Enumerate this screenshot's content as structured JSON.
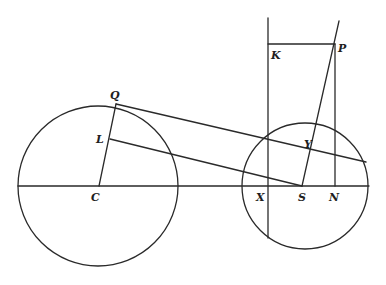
{
  "diagram": {
    "type": "geometric-figure",
    "stroke_color": "#2a2a2a",
    "background": "#ffffff",
    "circles": [
      {
        "id": "circle-C",
        "center_label": "C",
        "cx": 98,
        "cy": 186,
        "r": 80
      },
      {
        "id": "circle-S",
        "center_label": "S",
        "cx": 305,
        "cy": 186,
        "r": 63
      }
    ],
    "points": {
      "C": {
        "label": "C",
        "x": 98,
        "y": 186
      },
      "Q": {
        "label": "Q",
        "x": 116,
        "y": 104
      },
      "L": {
        "label": "L",
        "x": 110,
        "y": 139
      },
      "S": {
        "label": "S",
        "x": 302,
        "y": 186
      },
      "X": {
        "label": "X",
        "x": 268,
        "y": 186
      },
      "N": {
        "label": "N",
        "x": 335,
        "y": 186
      },
      "K": {
        "label": "K",
        "x": 268,
        "y": 44
      },
      "P": {
        "label": "P",
        "x": 335,
        "y": 44
      },
      "Y": {
        "label": "Y",
        "x": 314,
        "y": 152
      }
    },
    "labels": [
      {
        "text": "Q",
        "x": 110,
        "y": 99
      },
      {
        "text": "L",
        "x": 96,
        "y": 143
      },
      {
        "text": "C",
        "x": 91,
        "y": 201
      },
      {
        "text": "K",
        "x": 271,
        "y": 59
      },
      {
        "text": "P",
        "x": 338,
        "y": 52
      },
      {
        "text": "Y",
        "x": 304,
        "y": 148
      },
      {
        "text": "X",
        "x": 256,
        "y": 201
      },
      {
        "text": "S",
        "x": 298,
        "y": 201
      },
      {
        "text": "N",
        "x": 329,
        "y": 201
      }
    ],
    "segments": [
      {
        "name": "axis-line",
        "x1": 18,
        "y1": 186,
        "x2": 369,
        "y2": 186
      },
      {
        "name": "line-Q-C",
        "x1": 116,
        "y1": 104,
        "x2": 99,
        "y2": 186
      },
      {
        "name": "line-L-S",
        "x1": 110,
        "y1": 139,
        "x2": 302,
        "y2": 186
      },
      {
        "name": "line-Q-tangent",
        "x1": 116,
        "y1": 104,
        "x2": 366,
        "y2": 162
      },
      {
        "name": "vertical-K-X",
        "x1": 268,
        "y1": 18,
        "x2": 268,
        "y2": 238
      },
      {
        "name": "line-K-P",
        "x1": 268,
        "y1": 44,
        "x2": 335,
        "y2": 44
      },
      {
        "name": "vertical-P-N",
        "x1": 335,
        "y1": 44,
        "x2": 335,
        "y2": 186
      },
      {
        "name": "line-S-P-extended",
        "x1": 302,
        "y1": 186,
        "x2": 339,
        "y2": 21
      }
    ]
  }
}
